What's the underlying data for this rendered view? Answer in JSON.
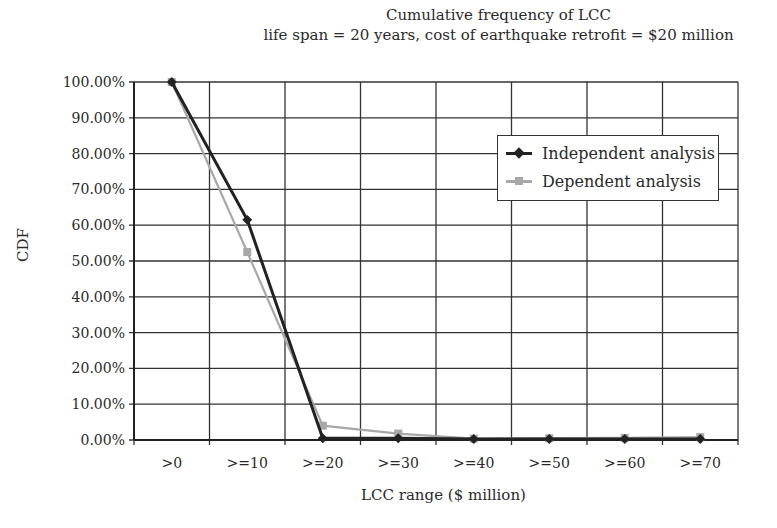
{
  "chart_data": {
    "type": "line",
    "title": "Cumulative frequency of LCC",
    "subtitle": "life span = 20 years, cost of earthquake retrofit = $20 million",
    "xlabel": "LCC range ($ million)",
    "ylabel": "CDF",
    "categories": [
      ">0",
      ">=10",
      ">=20",
      ">=30",
      ">=40",
      ">=50",
      ">=60",
      ">=70"
    ],
    "yticks": [
      "0.00%",
      "10.00%",
      "20.00%",
      "30.00%",
      "40.00%",
      "50.00%",
      "60.00%",
      "70.00%",
      "80.00%",
      "90.00%",
      "100.00%"
    ],
    "ylim": [
      0,
      100
    ],
    "grid": true,
    "legend_position": "upper right (inside)",
    "series": [
      {
        "name": "Independent analysis",
        "color": "#222222",
        "marker": "diamond",
        "values": [
          100,
          61.5,
          0.5,
          0.5,
          0.3,
          0.3,
          0.3,
          0.3
        ]
      },
      {
        "name": "Dependent analysis",
        "color": "#a8a8a8",
        "marker": "square",
        "values": [
          100,
          52.5,
          4.0,
          1.8,
          0.4,
          0.5,
          0.6,
          0.8
        ]
      }
    ]
  }
}
